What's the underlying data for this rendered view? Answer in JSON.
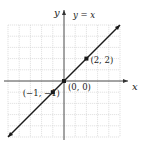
{
  "chart_data": {
    "type": "line",
    "title": "",
    "xlabel": "x",
    "ylabel": "y",
    "xlim": [
      -5,
      5
    ],
    "ylim": [
      -5,
      5
    ],
    "grid": true,
    "series": [
      {
        "name": "y = x",
        "label": "y = x",
        "function": "y = x",
        "x": [
          -5,
          5
        ],
        "y": [
          -5,
          5
        ]
      }
    ],
    "points": [
      {
        "x": -1,
        "y": -1,
        "label": "(−1, −1)"
      },
      {
        "x": 0,
        "y": 0,
        "label": "(0, 0)"
      },
      {
        "x": 2,
        "y": 2,
        "label": "(2, 2)"
      }
    ],
    "colors": {
      "line": "#1a1a1a",
      "grid": "#cfcfcf",
      "axis": "#333333"
    }
  }
}
